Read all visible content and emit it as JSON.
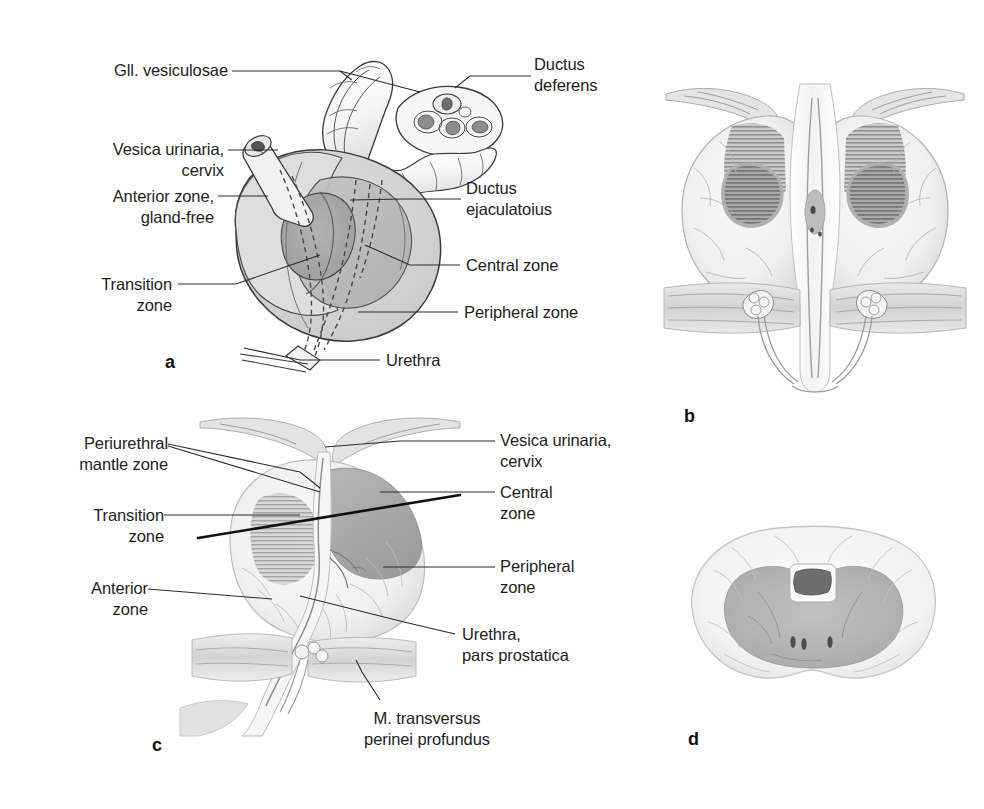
{
  "figure": {
    "background_color": "#ffffff",
    "text_color": "#1e1e1e",
    "leader_color": "#2b2b2b"
  },
  "panels": [
    {
      "id": "a",
      "letter": "a",
      "caption": "Schematic three-dimensional view of prostate zones with seminal glands and ductus deferens"
    },
    {
      "id": "b",
      "letter": "b",
      "caption": "Coronal section of the prostate"
    },
    {
      "id": "c",
      "letter": "c",
      "caption": "Sagittal section of the prostate"
    },
    {
      "id": "d",
      "letter": "d",
      "caption": "Transverse section of the prostate"
    }
  ],
  "panel_a_labels": {
    "gll_vesiculosae": "Gll. vesiculosae",
    "ductus_deferens_l1": "Ductus",
    "ductus_deferens_l2": "deferens",
    "vesica_urinaria_l1": "Vesica urinaria,",
    "vesica_urinaria_l2": "cervix",
    "anterior_zone_l1": "Anterior zone,",
    "anterior_zone_l2": "gland-free",
    "ductus_ejaculatorius_l1": "Ductus",
    "ductus_ejaculatorius_l2": "ejaculatoius",
    "transition_zone_l1": "Transition",
    "transition_zone_l2": "zone",
    "central_zone": "Central zone",
    "peripheral_zone": "Peripheral zone",
    "urethra": "Urethra"
  },
  "panel_c_labels": {
    "periurethral_l1": "Periurethral",
    "periurethral_l2": "mantle zone",
    "transition_l1": "Transition",
    "transition_l2": "zone",
    "anterior_l1": "Anterior",
    "anterior_l2": "zone",
    "vesica_l1": "Vesica urinaria,",
    "vesica_l2": "cervix",
    "central_l1": "Central",
    "central_l2": "zone",
    "peripheral_l1": "Peripheral",
    "peripheral_l2": "zone",
    "urethra_l1": "Urethra,",
    "urethra_l2": "pars prostatica",
    "transversus_l1": "M. transversus",
    "transversus_l2": "perinei profundus"
  },
  "zone_colors": {
    "peripheral_zone": "#d2d2d2",
    "central_zone": "#b9b9b9",
    "transition_zone": "#a7a7a7",
    "anterior_zone": "#dcdcdc",
    "outline": "#3a3a3a",
    "duct_lumen": "#7d7d7d",
    "tissue_light": "#f1f1f1",
    "tissue_mid": "#c9c9c9",
    "tissue_dark": "#9a9a9a"
  }
}
